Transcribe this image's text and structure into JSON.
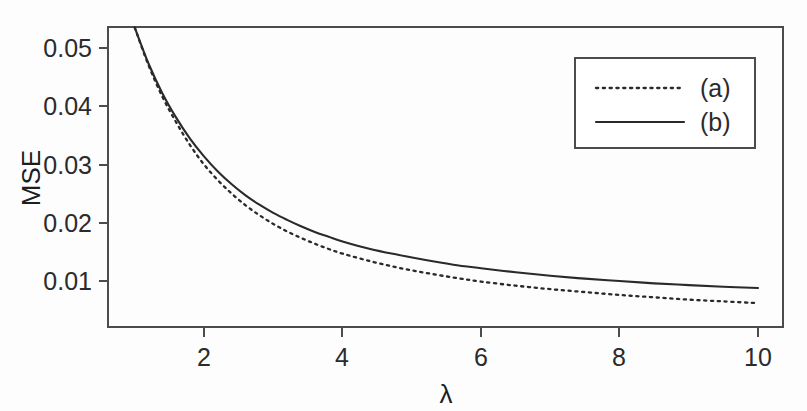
{
  "chart_data": {
    "type": "line",
    "title": "",
    "xlabel": "λ",
    "ylabel": "MSE",
    "xlim": [
      0.9,
      10.3
    ],
    "ylim": [
      0.0045,
      0.0565
    ],
    "xticks": [
      "2",
      "4",
      "6",
      "8",
      "10"
    ],
    "xtick_values": [
      2,
      4,
      6,
      8,
      10
    ],
    "yticks": [
      "0.01",
      "0.02",
      "0.03",
      "0.04",
      "0.05"
    ],
    "ytick_values": [
      0.01,
      0.02,
      0.03,
      0.04,
      0.05
    ],
    "grid": false,
    "legend_position": "top-right",
    "x": [
      1.0,
      1.2,
      1.4,
      1.6,
      1.8,
      2.0,
      2.2,
      2.4,
      2.6,
      2.8,
      3.0,
      3.2,
      3.4,
      3.6,
      3.8,
      4.0,
      4.4,
      4.8,
      5.2,
      5.6,
      6.0,
      6.5,
      7.0,
      7.5,
      8.0,
      8.5,
      9.0,
      9.5,
      10.0
    ],
    "series": [
      {
        "name": "(a)",
        "style": "dotted",
        "values": [
          0.0535,
          0.047,
          0.0416,
          0.0372,
          0.0333,
          0.03,
          0.0273,
          0.025,
          0.023,
          0.0213,
          0.0198,
          0.0185,
          0.0174,
          0.0164,
          0.0155,
          0.0147,
          0.0134,
          0.0123,
          0.0114,
          0.0106,
          0.0099,
          0.0092,
          0.0086,
          0.0081,
          0.0076,
          0.0072,
          0.0068,
          0.0065,
          0.0062
        ]
      },
      {
        "name": "(b)",
        "style": "solid",
        "values": [
          0.0535,
          0.0473,
          0.0422,
          0.038,
          0.0344,
          0.0314,
          0.0288,
          0.0266,
          0.0247,
          0.0231,
          0.0217,
          0.0205,
          0.0194,
          0.0184,
          0.0176,
          0.0168,
          0.0155,
          0.0145,
          0.0136,
          0.0128,
          0.0122,
          0.0115,
          0.0109,
          0.0104,
          0.01,
          0.0096,
          0.0093,
          0.009,
          0.0088
        ]
      }
    ]
  },
  "legend": {
    "entries": [
      {
        "label": "(a)",
        "style": "dotted"
      },
      {
        "label": "(b)",
        "style": "solid"
      }
    ]
  },
  "axes": {
    "y_title": "MSE",
    "x_title": "λ"
  },
  "colors": {
    "line": "#2a2a2a",
    "frame": "#4c4c4c",
    "background": "#fdfdfd",
    "text": "#2b2b2b"
  }
}
